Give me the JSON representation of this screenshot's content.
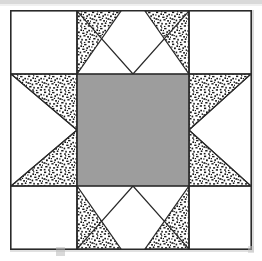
{
  "figure": {
    "alt_title": "Sawtooth / Variable Star block diagram",
    "canvas": {
      "width": 262,
      "height": 261
    }
  },
  "colors": {
    "center_fill": "#9d9d9d",
    "background_fill": "#ffffff",
    "stipple_dot": "#1a1a1a",
    "outline": "#2a2a2a",
    "scan_band": "#d9d9d9"
  },
  "block": {
    "frame": {
      "x": 10,
      "y": 10,
      "width": 242,
      "height": 240
    },
    "grid": {
      "columns": 3,
      "rows": 3,
      "vertical_lines": [
        76,
        188
      ],
      "horizontal_lines": [
        73,
        188
      ]
    },
    "units": [
      {
        "name": "corner-top-left",
        "row": 0,
        "col": 0,
        "type": "plain-square",
        "fabric": "background"
      },
      {
        "name": "star-point-top",
        "row": 0,
        "col": 1,
        "type": "flying-geese",
        "fabric": "stipple",
        "point_direction": "up"
      },
      {
        "name": "corner-top-right",
        "row": 0,
        "col": 2,
        "type": "plain-square",
        "fabric": "background"
      },
      {
        "name": "star-point-left",
        "row": 1,
        "col": 0,
        "type": "flying-geese",
        "fabric": "stipple",
        "point_direction": "left"
      },
      {
        "name": "center-square",
        "row": 1,
        "col": 1,
        "type": "plain-square",
        "fabric": "solid-gray"
      },
      {
        "name": "star-point-right",
        "row": 1,
        "col": 2,
        "type": "flying-geese",
        "fabric": "stipple",
        "point_direction": "right"
      },
      {
        "name": "corner-bottom-left",
        "row": 2,
        "col": 0,
        "type": "plain-square",
        "fabric": "background"
      },
      {
        "name": "star-point-bottom",
        "row": 2,
        "col": 1,
        "type": "flying-geese",
        "fabric": "stipple",
        "point_direction": "down"
      },
      {
        "name": "corner-bottom-right",
        "row": 2,
        "col": 2,
        "type": "plain-square",
        "fabric": "background"
      }
    ]
  },
  "chart_data": {
    "type": "diagram",
    "layout": "3x3 nine-patch",
    "legend": [
      {
        "label": "background",
        "swatch": "#ffffff"
      },
      {
        "label": "star points (stipple print)",
        "swatch": "#ffffff"
      },
      {
        "label": "center square (solid)",
        "swatch": "#9d9d9d"
      }
    ]
  }
}
